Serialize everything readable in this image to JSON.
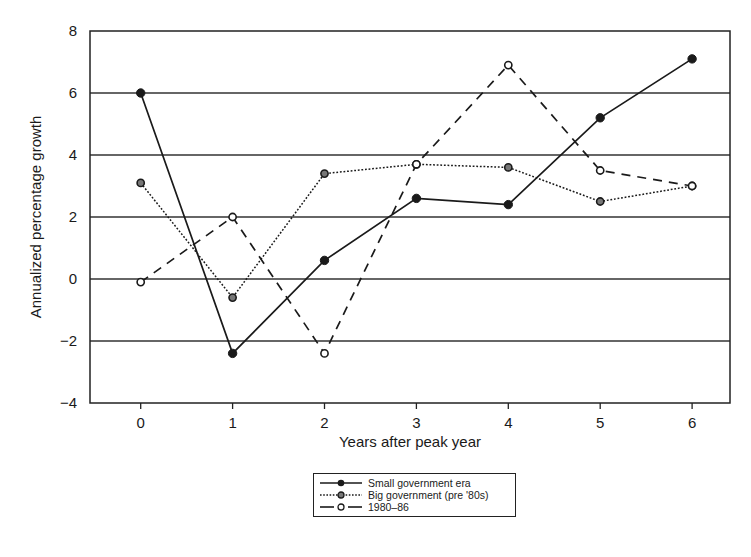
{
  "chart_data": {
    "type": "line",
    "title": "",
    "xlabel": "Years after peak year",
    "ylabel": "Annualized percentage growth",
    "x": [
      0,
      1,
      2,
      3,
      4,
      5,
      6
    ],
    "xlim": [
      -0.5,
      6.2
    ],
    "ylim": [
      -4,
      8
    ],
    "yticks": [
      -4,
      -2,
      0,
      2,
      4,
      6,
      8
    ],
    "ytick_labels": [
      "−4",
      "−2",
      "0",
      "2",
      "4",
      "6",
      "8"
    ],
    "xtick_labels": [
      "0",
      "1",
      "2",
      "3",
      "4",
      "5",
      "6"
    ],
    "grid": "horizontal",
    "legend_position": "below",
    "series": [
      {
        "name": "Small government era",
        "style": "solid",
        "marker": "filled-circle",
        "values": [
          6.0,
          -2.4,
          0.6,
          2.6,
          2.4,
          5.2,
          7.1
        ]
      },
      {
        "name": "Big government (pre '80s)",
        "style": "dotted",
        "marker": "half-filled-circle",
        "values": [
          3.1,
          -0.6,
          3.4,
          3.7,
          3.6,
          2.5,
          3.0
        ]
      },
      {
        "name": "1980–86",
        "style": "dashed",
        "marker": "open-circle",
        "values": [
          -0.1,
          2.0,
          -2.4,
          3.7,
          6.9,
          3.5,
          3.0
        ]
      }
    ]
  },
  "legend": {
    "items": [
      {
        "label": "Small government era"
      },
      {
        "label": "Big government (pre '80s)"
      },
      {
        "label": "1980–86"
      }
    ]
  },
  "colors": {
    "line": "#1a1a1a",
    "grid": "#333333",
    "background": "#ffffff"
  }
}
